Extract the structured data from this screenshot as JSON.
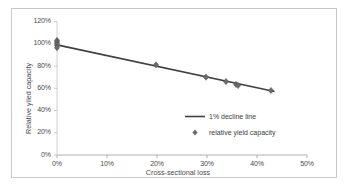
{
  "chart_data": {
    "type": "scatter",
    "title": "",
    "xlabel": "Cross-sectional loss",
    "ylabel": "Relative yiled capacity",
    "xlim": [
      0,
      50
    ],
    "ylim": [
      0,
      120
    ],
    "grid": false,
    "legend_position": "center-right",
    "x_tick_labels": [
      "0%",
      "10%",
      "20%",
      "30%",
      "40%",
      "50%"
    ],
    "x_tick_values": [
      0,
      10,
      20,
      30,
      40,
      50
    ],
    "y_tick_labels": [
      "0%",
      "20%",
      "40%",
      "60%",
      "80%",
      "100%",
      "120%"
    ],
    "y_tick_values": [
      0,
      20,
      40,
      60,
      80,
      100,
      120
    ],
    "series": [
      {
        "name": "1% decline line",
        "type": "line",
        "color": "#404040",
        "x": [
          0,
          43.5
        ],
        "values": [
          99.0,
          57.0
        ]
      },
      {
        "name": "relative yield capacity",
        "type": "scatter",
        "marker": "diamond",
        "color": "#6b6b6b",
        "x": [
          0.0,
          0.0,
          0.0,
          0.0,
          0.0,
          19.8,
          29.8,
          33.8,
          35.8,
          36.2,
          42.8
        ],
        "values": [
          103.0,
          101.5,
          100.0,
          98.5,
          96.5,
          81.0,
          70.0,
          66.0,
          63.5,
          62.5,
          58.0
        ]
      }
    ]
  },
  "legend": {
    "line_label": "1% decline line",
    "marker_label": "relative yield capacity"
  }
}
